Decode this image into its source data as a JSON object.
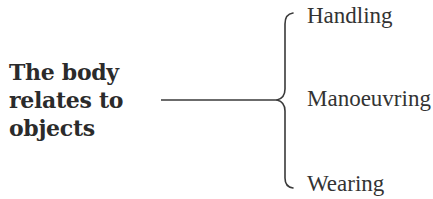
{
  "diagram": {
    "type": "brace-tree",
    "root": {
      "lines": [
        "The body",
        "relates to",
        "objects"
      ]
    },
    "branches": [
      {
        "label": "Handling"
      },
      {
        "label": "Manoeuvring"
      },
      {
        "label": "Wearing"
      }
    ],
    "colors": {
      "text": "#2b2b2b",
      "line": "#3a3a3a",
      "background": "#ffffff"
    }
  }
}
